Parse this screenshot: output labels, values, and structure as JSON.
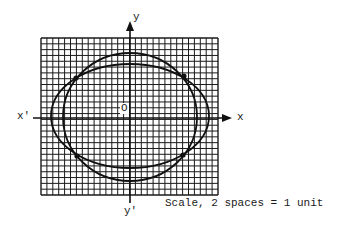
{
  "diagram": {
    "type": "coordinate-grid-with-curves",
    "grid": {
      "left": 41,
      "top": 38,
      "right": 218,
      "bottom": 195,
      "columns": 30,
      "rows": 27,
      "line_color": "#1a1a1a"
    },
    "axes": {
      "x_label": "x",
      "x_neg_label": "x'",
      "y_label": "y",
      "y_neg_label": "y'",
      "origin_label": "O"
    },
    "curves": [
      {
        "name": "wide-ellipse",
        "cx": 130,
        "cy": 116,
        "rx": 79,
        "ry": 52
      },
      {
        "name": "tall-ellipse",
        "cx": 130,
        "cy": 117,
        "rx": 67,
        "ry": 64
      }
    ],
    "intersection_points": [
      {
        "x": 76,
        "y": 78
      },
      {
        "x": 184,
        "y": 76
      },
      {
        "x": 77,
        "y": 156
      },
      {
        "x": 183,
        "y": 155
      }
    ],
    "scale_note": "Scale, 2 spaces = 1 unit"
  }
}
